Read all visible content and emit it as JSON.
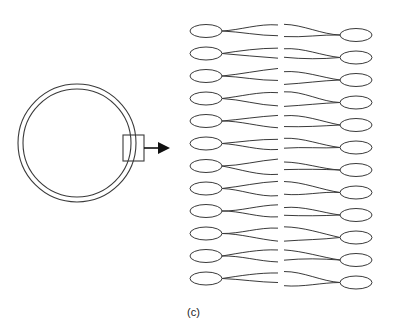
{
  "figure": {
    "label": "(c)",
    "stroke_color": "#3a3a3a",
    "vesicle": {
      "cx": 77,
      "cy": 143,
      "outer_r": 59,
      "inner_r": 54
    },
    "zoom_box": {
      "x": 123,
      "y": 135,
      "w": 21,
      "h": 26
    },
    "arrow": {
      "x1": 144,
      "y1": 148,
      "x2": 170,
      "head": "right"
    },
    "bilayer": {
      "rows": 12,
      "left_heads_cx": 206,
      "right_heads_cx": 356,
      "head_rx": 16,
      "head_ry": 6.5,
      "left_first_cy": 31,
      "right_first_cy": 35,
      "row_spacing": 22.5,
      "midline_x": 281
    }
  }
}
